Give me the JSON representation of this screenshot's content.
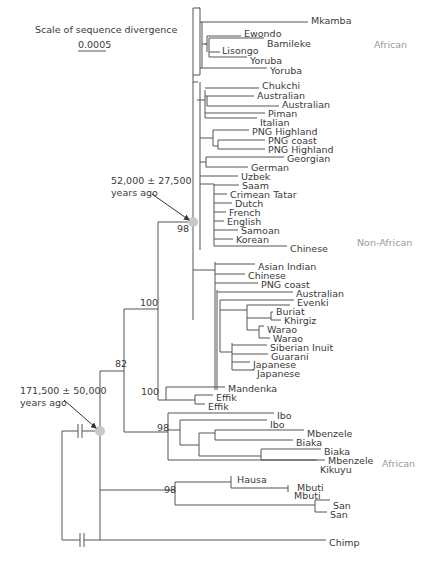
{
  "scale": {
    "title": "Scale of sequence divergence",
    "value": "0.0005",
    "bar": {
      "x1": 78,
      "x2": 106,
      "y": 51
    }
  },
  "group_labels": [
    {
      "text": "African",
      "x": 374,
      "y": 48
    },
    {
      "text": "Non-African",
      "x": 357,
      "y": 246
    },
    {
      "text": "African",
      "x": 382,
      "y": 467
    }
  ],
  "annotations": [
    {
      "line1": "52,000 ± 27,500",
      "line2": "years ago",
      "x": 111,
      "y": 184,
      "arrow": {
        "x1": 152,
        "y1": 194,
        "x2": 189,
        "y2": 220
      }
    },
    {
      "line1": "171,500 ± 50,000",
      "line2": "years ago",
      "x": 20,
      "y": 394,
      "arrow": {
        "x1": 64,
        "y1": 400,
        "x2": 96,
        "y2": 428
      }
    }
  ],
  "nodes_highlight": [
    {
      "x": 193,
      "y": 222,
      "r": 5
    },
    {
      "x": 100,
      "y": 431,
      "r": 5
    }
  ],
  "support_values": [
    {
      "text": "98",
      "x": 177,
      "y": 232
    },
    {
      "text": "100",
      "x": 140,
      "y": 306
    },
    {
      "text": "82",
      "x": 115,
      "y": 367
    },
    {
      "text": "100",
      "x": 141,
      "y": 395
    },
    {
      "text": "98",
      "x": 157,
      "y": 431
    },
    {
      "text": "98",
      "x": 164,
      "y": 493
    }
  ],
  "leaves": [
    {
      "name": "Mkamba",
      "x": 311,
      "y": 20
    },
    {
      "name": "Ewondo",
      "x": 244,
      "y": 33
    },
    {
      "name": "Bamileke",
      "x": 267,
      "y": 43
    },
    {
      "name": "Lisongo",
      "x": 222,
      "y": 50
    },
    {
      "name": "Yoruba",
      "x": 250,
      "y": 60
    },
    {
      "name": "Yoruba",
      "x": 270,
      "y": 70
    },
    {
      "name": "Chukchi",
      "x": 262,
      "y": 85
    },
    {
      "name": "Australian",
      "x": 257,
      "y": 95
    },
    {
      "name": "Australian",
      "x": 282,
      "y": 104
    },
    {
      "name": "Piman",
      "x": 268,
      "y": 113
    },
    {
      "name": "Italian",
      "x": 260,
      "y": 122
    },
    {
      "name": "PNG Highland",
      "x": 252,
      "y": 131
    },
    {
      "name": "PNG coast",
      "x": 268,
      "y": 140
    },
    {
      "name": "PNG Highland",
      "x": 268,
      "y": 149
    },
    {
      "name": "Georgian",
      "x": 287,
      "y": 158
    },
    {
      "name": "German",
      "x": 251,
      "y": 167
    },
    {
      "name": "Uzbek",
      "x": 241,
      "y": 176
    },
    {
      "name": "Saam",
      "x": 242,
      "y": 185
    },
    {
      "name": "Crimean Tatar",
      "x": 230,
      "y": 194
    },
    {
      "name": "Dutch",
      "x": 235,
      "y": 203
    },
    {
      "name": "French",
      "x": 229,
      "y": 212
    },
    {
      "name": "English",
      "x": 227,
      "y": 221
    },
    {
      "name": "Samoan",
      "x": 241,
      "y": 230
    },
    {
      "name": "Korean",
      "x": 236,
      "y": 239
    },
    {
      "name": "Chinese",
      "x": 290,
      "y": 248
    },
    {
      "name": "Asian Indian",
      "x": 258,
      "y": 266
    },
    {
      "name": "Chinese",
      "x": 248,
      "y": 275
    },
    {
      "name": "PNG coast",
      "x": 261,
      "y": 284
    },
    {
      "name": "Australian",
      "x": 296,
      "y": 293
    },
    {
      "name": "Evenki",
      "x": 297,
      "y": 302
    },
    {
      "name": "Buriat",
      "x": 276,
      "y": 311
    },
    {
      "name": "Khirgiz",
      "x": 284,
      "y": 320
    },
    {
      "name": "Warao",
      "x": 267,
      "y": 329
    },
    {
      "name": "Warao",
      "x": 273,
      "y": 338
    },
    {
      "name": "Siberian Inuit",
      "x": 270,
      "y": 347
    },
    {
      "name": "Guarani",
      "x": 271,
      "y": 356
    },
    {
      "name": "Japanese",
      "x": 253,
      "y": 364
    },
    {
      "name": "Japanese",
      "x": 257,
      "y": 373
    },
    {
      "name": "Mandenka",
      "x": 228,
      "y": 388
    },
    {
      "name": "Effik",
      "x": 216,
      "y": 397
    },
    {
      "name": "Effik",
      "x": 208,
      "y": 406
    },
    {
      "name": "Ibo",
      "x": 277,
      "y": 415
    },
    {
      "name": "Ibo",
      "x": 270,
      "y": 424
    },
    {
      "name": "Mbenzele",
      "x": 307,
      "y": 433
    },
    {
      "name": "Biaka",
      "x": 296,
      "y": 442
    },
    {
      "name": "Biaka",
      "x": 324,
      "y": 451
    },
    {
      "name": "Mbenzele",
      "x": 328,
      "y": 460
    },
    {
      "name": "Kikuyu",
      "x": 320,
      "y": 469
    },
    {
      "name": "Hausa",
      "x": 237,
      "y": 479
    },
    {
      "name": "Mbuti",
      "x": 297,
      "y": 487
    },
    {
      "name": "Mbuti",
      "x": 294,
      "y": 495
    },
    {
      "name": "San",
      "x": 333,
      "y": 505
    },
    {
      "name": "San",
      "x": 330,
      "y": 514
    },
    {
      "name": "Chimp",
      "x": 329,
      "y": 542
    }
  ],
  "branches": [
    [
      193,
      8,
      193,
      320
    ],
    [
      193,
      8,
      200,
      8
    ],
    [
      200,
      8,
      200,
      75
    ],
    [
      200,
      75,
      193,
      75
    ],
    [
      200,
      8,
      199,
      8
    ],
    [
      202,
      22,
      202,
      68
    ],
    [
      200,
      22,
      202,
      22
    ],
    [
      202,
      22,
      308,
      22
    ],
    [
      202,
      44,
      207,
      44
    ],
    [
      207,
      36,
      207,
      52
    ],
    [
      207,
      36,
      241,
      36
    ],
    [
      207,
      44,
      205,
      44
    ],
    [
      209,
      38,
      209,
      57
    ],
    [
      209,
      38,
      264,
      38
    ],
    [
      209,
      52,
      220,
      52
    ],
    [
      209,
      57,
      247,
      57
    ],
    [
      200,
      68,
      267,
      68
    ],
    [
      193,
      82,
      198,
      82
    ],
    [
      193,
      82,
      193,
      82
    ],
    [
      200,
      82,
      200,
      250
    ],
    [
      197,
      100,
      200,
      100
    ],
    [
      205,
      90,
      205,
      118
    ],
    [
      200,
      100,
      205,
      100
    ],
    [
      205,
      88,
      259,
      88
    ],
    [
      207,
      96,
      207,
      106
    ],
    [
      205,
      96,
      207,
      96
    ],
    [
      207,
      96,
      254,
      96
    ],
    [
      207,
      106,
      279,
      106
    ],
    [
      205,
      113,
      265,
      113
    ],
    [
      205,
      118,
      257,
      118
    ],
    [
      200,
      138,
      213,
      138
    ],
    [
      213,
      130,
      213,
      146
    ],
    [
      213,
      130,
      249,
      130
    ],
    [
      213,
      146,
      218,
      146
    ],
    [
      218,
      140,
      218,
      149
    ],
    [
      218,
      140,
      265,
      140
    ],
    [
      218,
      149,
      265,
      149
    ],
    [
      200,
      162,
      206,
      162
    ],
    [
      206,
      157,
      206,
      167
    ],
    [
      206,
      157,
      284,
      157
    ],
    [
      206,
      167,
      248,
      167
    ],
    [
      200,
      176,
      238,
      176
    ],
    [
      200,
      184,
      214,
      184
    ],
    [
      214,
      184,
      214,
      246
    ],
    [
      214,
      185,
      239,
      185
    ],
    [
      214,
      194,
      227,
      194
    ],
    [
      214,
      203,
      232,
      203
    ],
    [
      214,
      212,
      226,
      212
    ],
    [
      214,
      221,
      224,
      221
    ],
    [
      214,
      230,
      238,
      230
    ],
    [
      214,
      239,
      233,
      239
    ],
    [
      214,
      246,
      287,
      246
    ],
    [
      193,
      222,
      158,
      222
    ],
    [
      158,
      222,
      158,
      309
    ],
    [
      215,
      262,
      215,
      390
    ],
    [
      193,
      270,
      215,
      270
    ],
    [
      215,
      264,
      255,
      264
    ],
    [
      215,
      274,
      245,
      274
    ],
    [
      215,
      283,
      258,
      283
    ],
    [
      217,
      292,
      293,
      292
    ],
    [
      217,
      290,
      217,
      390
    ],
    [
      220,
      300,
      294,
      300
    ],
    [
      220,
      300,
      220,
      352
    ],
    [
      220,
      310,
      247,
      310
    ],
    [
      247,
      305,
      247,
      330
    ],
    [
      247,
      305,
      290,
      305
    ],
    [
      247,
      318,
      271,
      318
    ],
    [
      271,
      312,
      271,
      320
    ],
    [
      271,
      312,
      273,
      312
    ],
    [
      271,
      320,
      281,
      320
    ],
    [
      247,
      330,
      259,
      330
    ],
    [
      259,
      326,
      259,
      338
    ],
    [
      259,
      326,
      264,
      326
    ],
    [
      259,
      338,
      270,
      338
    ],
    [
      220,
      352,
      232,
      352
    ],
    [
      232,
      343,
      232,
      370
    ],
    [
      232,
      345,
      267,
      345
    ],
    [
      232,
      354,
      268,
      354
    ],
    [
      232,
      362,
      250,
      362
    ],
    [
      232,
      370,
      254,
      370
    ],
    [
      158,
      309,
      124,
      309
    ],
    [
      124,
      309,
      124,
      371
    ],
    [
      158,
      309,
      158,
      400
    ],
    [
      158,
      400,
      166,
      400
    ],
    [
      166,
      387,
      166,
      400
    ],
    [
      166,
      387,
      225,
      387
    ],
    [
      166,
      400,
      195,
      400
    ],
    [
      195,
      395,
      195,
      404
    ],
    [
      195,
      395,
      213,
      395
    ],
    [
      195,
      404,
      205,
      404
    ],
    [
      124,
      371,
      124,
      432
    ],
    [
      100,
      371,
      124,
      371
    ],
    [
      124,
      432,
      168,
      432
    ],
    [
      168,
      413,
      168,
      460
    ],
    [
      168,
      413,
      274,
      413
    ],
    [
      168,
      430,
      180,
      430
    ],
    [
      180,
      420,
      180,
      445
    ],
    [
      180,
      420,
      267,
      420
    ],
    [
      180,
      445,
      199,
      445
    ],
    [
      199,
      433,
      199,
      456
    ],
    [
      199,
      433,
      215,
      433
    ],
    [
      215,
      430,
      215,
      440
    ],
    [
      215,
      430,
      304,
      430
    ],
    [
      215,
      440,
      293,
      440
    ],
    [
      199,
      456,
      261,
      456
    ],
    [
      261,
      449,
      261,
      460
    ],
    [
      261,
      449,
      321,
      449
    ],
    [
      261,
      460,
      325,
      460
    ],
    [
      168,
      460,
      317,
      460
    ],
    [
      100,
      371,
      100,
      540
    ],
    [
      100,
      490,
      175,
      490
    ],
    [
      175,
      482,
      175,
      505
    ],
    [
      175,
      482,
      231,
      482
    ],
    [
      231,
      476,
      231,
      488
    ],
    [
      231,
      488,
      288,
      488
    ],
    [
      288,
      485,
      288,
      492
    ],
    [
      175,
      505,
      315,
      505
    ],
    [
      315,
      500,
      315,
      512
    ],
    [
      315,
      500,
      330,
      500
    ],
    [
      315,
      512,
      327,
      512
    ]
  ],
  "outgroup": {
    "root_x": 62,
    "root_top": 431,
    "root_bottom": 540,
    "chimp_line": [
      62,
      540,
      326,
      540
    ],
    "ingroup_line": [
      62,
      431,
      100,
      431
    ],
    "breaks": [
      {
        "x": 80,
        "y": 431
      },
      {
        "x": 82,
        "y": 540
      }
    ]
  }
}
